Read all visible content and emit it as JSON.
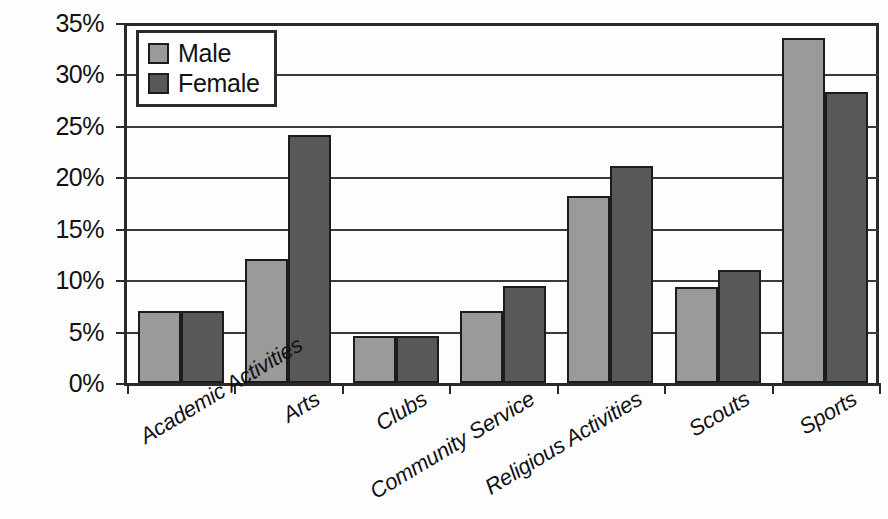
{
  "chart_data": {
    "type": "bar",
    "title": "",
    "subtitle": "",
    "xlabel": "",
    "ylabel": "",
    "categories": [
      "Academic Activities",
      "Arts",
      "Clubs",
      "Community Service",
      "Religious Activities",
      "Scouts",
      "Sports"
    ],
    "series": [
      {
        "name": "Male",
        "color": "#9a9a9a",
        "values": [
          7.0,
          12.1,
          4.6,
          7.0,
          18.2,
          9.3,
          33.5
        ]
      },
      {
        "name": "Female",
        "color": "#585858",
        "values": [
          7.0,
          24.1,
          4.6,
          9.4,
          21.1,
          11.0,
          28.3
        ]
      }
    ],
    "ylim": [
      0,
      35
    ],
    "ytick_values": [
      35,
      30,
      25,
      20,
      15,
      10,
      5,
      0
    ],
    "ytick_labels": [
      "35%",
      "30%",
      "25%",
      "20%",
      "15%",
      "10%",
      "5%",
      "0%"
    ],
    "grid": "horizontal",
    "legend_position": "top-left",
    "value_suffix": "%"
  }
}
